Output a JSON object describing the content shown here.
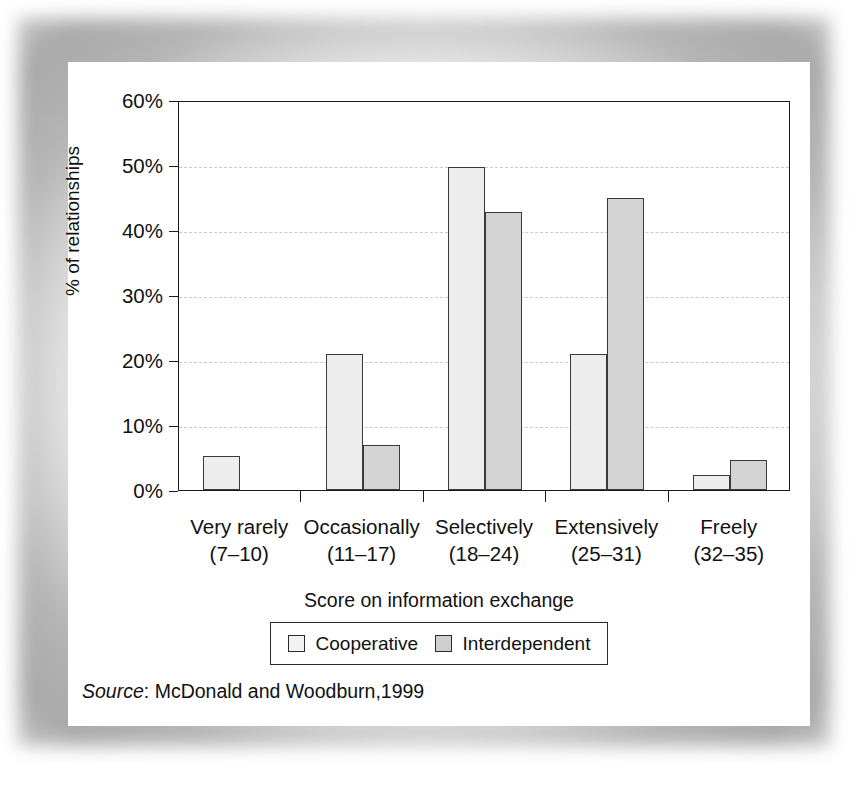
{
  "chart_data": {
    "type": "bar",
    "title": "",
    "xlabel": "Score on information exchange",
    "ylabel": "% of relationships",
    "categories": [
      "Very rarely",
      "Occasionally",
      "Selectively",
      "Extensively",
      "Freely"
    ],
    "category_ranges": [
      "(7–10)",
      "(11–17)",
      "(18–24)",
      "(25–31)",
      "(32–35)"
    ],
    "series": [
      {
        "name": "Cooperative",
        "values": [
          5.2,
          21.0,
          49.7,
          21.0,
          2.3
        ],
        "color": "#ededed"
      },
      {
        "name": "Interdependent",
        "values": [
          0,
          7.0,
          42.7,
          45.0,
          4.6
        ],
        "color": "#d4d4d4"
      }
    ],
    "ylim": [
      0,
      60
    ],
    "yticks": [
      0,
      10,
      20,
      30,
      40,
      50,
      60
    ],
    "ytick_labels": [
      "0%",
      "10%",
      "20%",
      "30%",
      "40%",
      "50%",
      "60%"
    ],
    "grid": true,
    "grid_style": "dashed-horizontal",
    "legend_position": "bottom-center"
  },
  "legend": {
    "entries": [
      {
        "label": "Cooperative",
        "swatch": "legend-swatch-cooperative"
      },
      {
        "label": "Interdependent",
        "swatch": "legend-swatch-interdependent"
      }
    ]
  },
  "source": {
    "label": "Source",
    "separator": ": ",
    "text": "McDonald and Woodburn,1999"
  }
}
